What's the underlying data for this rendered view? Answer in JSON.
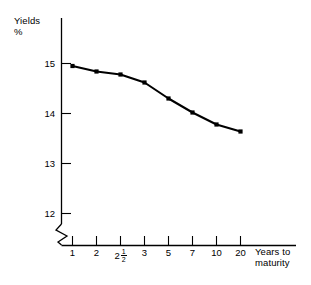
{
  "chart_data": {
    "type": "line",
    "title": "",
    "ylabel": "Yields\n%",
    "ylabel_line1": "Yields",
    "ylabel_line2": "%",
    "xlabel_line1": "Years to",
    "xlabel_line2": "maturity",
    "x_tick_labels": [
      "1",
      "2",
      "2½",
      "3",
      "5",
      "7",
      "10",
      "20"
    ],
    "x_categories": [
      "1",
      "2",
      "2.5",
      "3",
      "5",
      "7",
      "10",
      "20"
    ],
    "values": [
      14.95,
      14.84,
      14.78,
      14.62,
      14.3,
      14.02,
      13.78,
      13.64
    ],
    "y_tick_labels": [
      "15",
      "14",
      "13",
      "12"
    ],
    "y_ticks": [
      15,
      14,
      13,
      12
    ],
    "ylim": [
      12,
      15.3
    ],
    "axis_break": true,
    "grid": false,
    "legend": "none",
    "marker": "square",
    "line_color": "#000000",
    "marker_color": "#000000",
    "background_color": "#ffffff"
  },
  "axis_titles": {
    "y_line1": "Yields",
    "y_line2": "%",
    "x_line1": "Years to",
    "x_line2": "maturity"
  },
  "x_ticks": [
    {
      "label_main": "1",
      "label_frac_num": "",
      "label_frac_den": ""
    },
    {
      "label_main": "2",
      "label_frac_num": "",
      "label_frac_den": ""
    },
    {
      "label_main": "2",
      "label_frac_num": "1",
      "label_frac_den": "2"
    },
    {
      "label_main": "3",
      "label_frac_num": "",
      "label_frac_den": ""
    },
    {
      "label_main": "5",
      "label_frac_num": "",
      "label_frac_den": ""
    },
    {
      "label_main": "7",
      "label_frac_num": "",
      "label_frac_den": ""
    },
    {
      "label_main": "10",
      "label_frac_num": "",
      "label_frac_den": ""
    },
    {
      "label_main": "20",
      "label_frac_num": "",
      "label_frac_den": ""
    }
  ],
  "y_ticks": [
    {
      "label": "15"
    },
    {
      "label": "14"
    },
    {
      "label": "13"
    },
    {
      "label": "12"
    }
  ]
}
